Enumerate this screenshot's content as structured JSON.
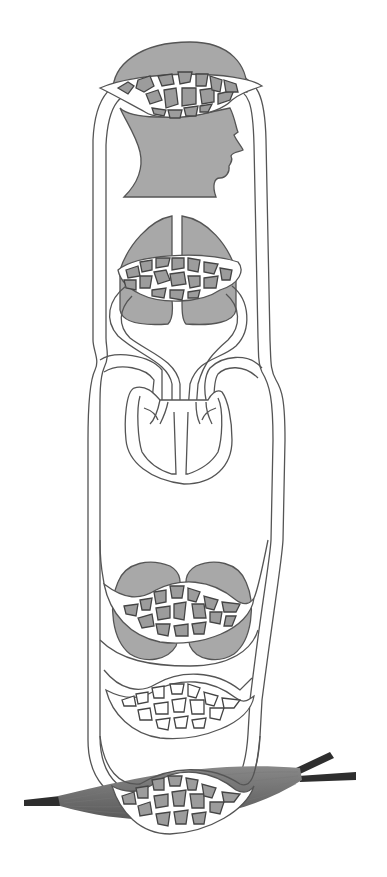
{
  "diagram": {
    "type": "circulatory-system-schematic",
    "colors": {
      "background": "#ffffff",
      "organ_fill": "#a8a8a8",
      "capillary_cell_fill": "#9c9c9c",
      "outline": "#555555",
      "muscle": "#6e6e6e",
      "tendon": "#2e2e2e"
    },
    "components": [
      {
        "id": "brain-capillary-bed",
        "organ": "head",
        "cells": "filled"
      },
      {
        "id": "lung-capillary-bed",
        "organ": "lungs",
        "cells": "filled"
      },
      {
        "id": "heart",
        "organ": "heart",
        "cells": "none"
      },
      {
        "id": "kidney-capillary-bed",
        "organ": "kidneys",
        "cells": "filled"
      },
      {
        "id": "unfilled-capillary-bed",
        "organ": "none",
        "cells": "empty"
      },
      {
        "id": "muscle-capillary-bed",
        "organ": "muscle",
        "cells": "filled"
      }
    ]
  }
}
